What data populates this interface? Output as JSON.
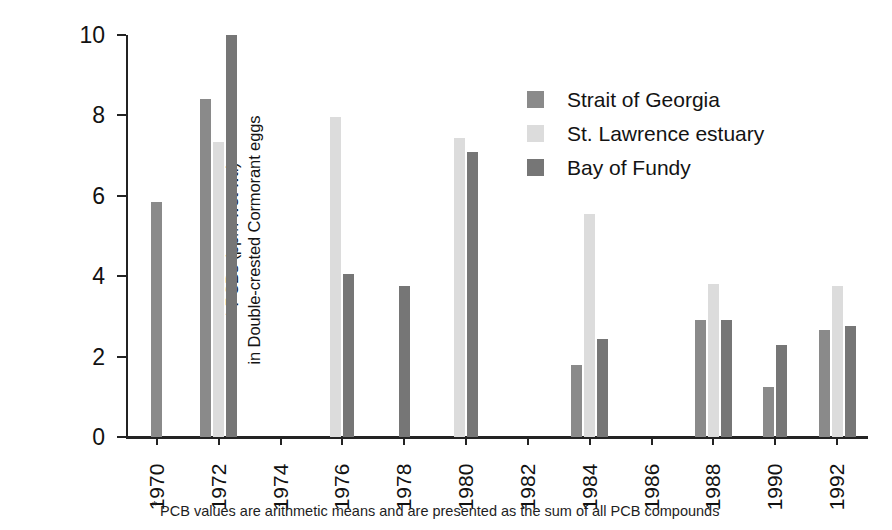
{
  "chart_data": {
    "type": "bar",
    "title": "",
    "subtitle": "",
    "xlabel": "",
    "ylabel": "* PCBs (ppm wet wt.) in Double-crested Cormorant eggs",
    "ylabel_lines": [
      "* PCBs (ppm wet wt.)",
      "in Double-crested Cormorant eggs"
    ],
    "categories": [
      "1970",
      "1972",
      "1974",
      "1976",
      "1978",
      "1980",
      "1982",
      "1984",
      "1986",
      "1988",
      "1990",
      "1992"
    ],
    "ylim": [
      0,
      10
    ],
    "yticks": [
      0,
      2,
      4,
      6,
      8,
      10
    ],
    "ytick_labels": [
      "0",
      "2",
      "4",
      "6",
      "8",
      "10"
    ],
    "grid": false,
    "legend_position": "upper-right",
    "series": [
      {
        "name": "Strait of Georgia",
        "color": "#8a8a8a",
        "values": [
          5.85,
          8.4,
          null,
          null,
          null,
          null,
          null,
          1.8,
          null,
          2.9,
          1.25,
          2.65
        ]
      },
      {
        "name": "St. Lawrence estuary",
        "color": "#dcdcdc",
        "values": [
          null,
          7.35,
          null,
          7.95,
          null,
          7.45,
          null,
          5.55,
          null,
          3.8,
          null,
          3.75
        ]
      },
      {
        "name": "Bay of Fundy",
        "color": "#767676",
        "values": [
          null,
          10.0,
          null,
          4.05,
          3.75,
          7.1,
          null,
          2.45,
          null,
          2.9,
          2.3,
          2.75
        ]
      }
    ],
    "annotations": [
      "PCB values are arithmetic means and are presented as the sum of all PCB compounds"
    ]
  },
  "legend": {
    "items": [
      {
        "label": "Strait of Georgia",
        "swatch": "s0"
      },
      {
        "label": "St. Lawrence estuary",
        "swatch": "s1"
      },
      {
        "label": "Bay of Fundy",
        "swatch": "s2"
      }
    ]
  },
  "footnote": {
    "marker": "*",
    "text": "PCB values are arithmetic means and are presented as the sum of all PCB compounds"
  }
}
